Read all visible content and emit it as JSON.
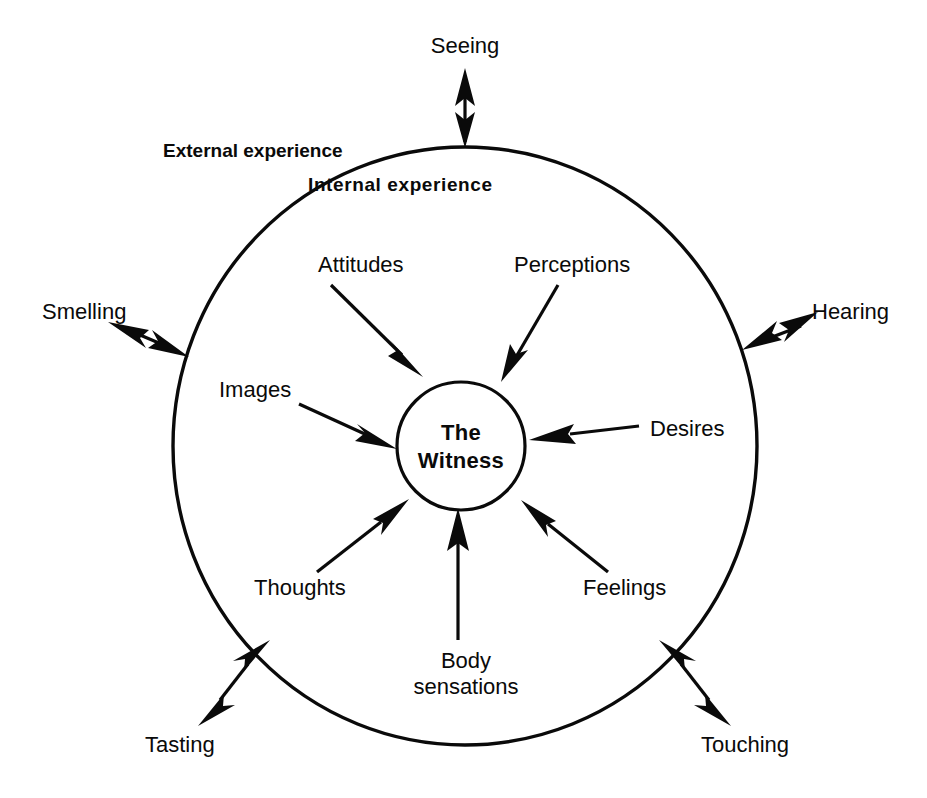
{
  "diagram": {
    "center": {
      "line1": "The",
      "line2": "Witness"
    },
    "zones": [
      {
        "name": "external-experience",
        "label": "External experience"
      },
      {
        "name": "internal-experience",
        "label": "Internal experience"
      }
    ],
    "external_senses": [
      {
        "name": "seeing",
        "label": "Seeing",
        "direction": "bidirectional",
        "position": "top"
      },
      {
        "name": "hearing",
        "label": "Hearing",
        "direction": "bidirectional",
        "position": "right"
      },
      {
        "name": "touching",
        "label": "Touching",
        "direction": "bidirectional",
        "position": "bottom-right"
      },
      {
        "name": "tasting",
        "label": "Tasting",
        "direction": "bidirectional",
        "position": "bottom-left"
      },
      {
        "name": "smelling",
        "label": "Smelling",
        "direction": "bidirectional",
        "position": "left"
      }
    ],
    "internal_contents": [
      {
        "name": "attitudes",
        "label": "Attitudes",
        "direction": "inward",
        "position": "upper-left"
      },
      {
        "name": "perceptions",
        "label": "Perceptions",
        "direction": "inward",
        "position": "upper-right"
      },
      {
        "name": "images",
        "label": "Images",
        "direction": "inward",
        "position": "left"
      },
      {
        "name": "desires",
        "label": "Desires",
        "direction": "inward",
        "position": "right"
      },
      {
        "name": "thoughts",
        "label": "Thoughts",
        "direction": "inward",
        "position": "lower-left"
      },
      {
        "name": "feelings",
        "label": "Feelings",
        "direction": "inward",
        "position": "lower-right"
      },
      {
        "name": "body-sensations",
        "label": "Body sensations",
        "label_line1": "Body",
        "label_line2": "sensations",
        "direction": "inward",
        "position": "bottom"
      }
    ],
    "colors": {
      "ink": "#0a0a0a",
      "background": "#ffffff"
    }
  }
}
